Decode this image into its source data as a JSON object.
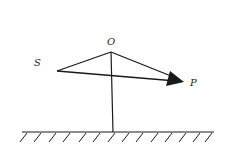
{
  "diagram": {
    "type": "physics-force-diagram",
    "labels": {
      "O": "O",
      "S": "S",
      "P": "P"
    },
    "points": {
      "O": [
        111,
        52
      ],
      "S": [
        57,
        71
      ],
      "P_tip": [
        184,
        82
      ],
      "ground_foot": [
        113,
        132
      ]
    },
    "ground": {
      "x_start": 22,
      "x_end": 214,
      "y": 132,
      "hatch_count": 14
    },
    "colors": {
      "line": "#1a1a1a",
      "background": "#ffffff"
    }
  }
}
